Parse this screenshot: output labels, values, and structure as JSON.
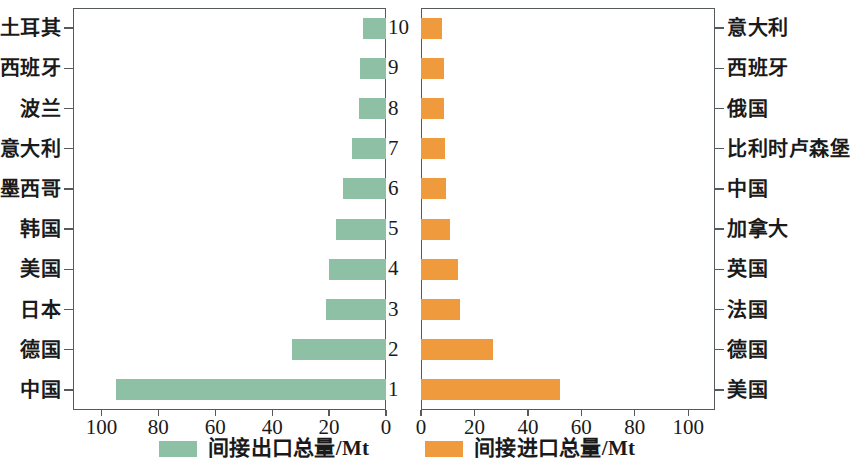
{
  "chart_data": {
    "type": "bar",
    "title": "",
    "orientation": "horizontal",
    "layout": "back-to-back dual panel (mirrored bar chart)",
    "panels": [
      {
        "id": "left",
        "name": "indirect-export",
        "legend_label": "间接出口总量/Mt",
        "series_name": "间接出口总量/Mt",
        "color": "#8ec0a6",
        "direction": "right-to-left",
        "xlabel": "",
        "ylabel": "",
        "xlim": [
          0,
          110
        ],
        "xticks": [
          100,
          80,
          60,
          40,
          20,
          0
        ],
        "xtick_labels": [
          "100",
          "80",
          "60",
          "40",
          "20",
          "0"
        ],
        "grid": false,
        "categories": [
          "土耳其",
          "西班牙",
          "波兰",
          "意大利",
          "墨西哥",
          "韩国",
          "美国",
          "日本",
          "德国",
          "中国"
        ],
        "values": [
          8,
          9,
          9.5,
          12,
          15,
          17.5,
          20,
          21,
          33,
          95
        ],
        "ranks": [
          10,
          9,
          8,
          7,
          6,
          5,
          4,
          3,
          2,
          1
        ]
      },
      {
        "id": "right",
        "name": "indirect-import",
        "legend_label": "间接进口总量/Mt",
        "series_name": "间接进口总量/Mt",
        "color": "#f09a3e",
        "direction": "left-to-right",
        "xlabel": "",
        "ylabel": "",
        "xlim": [
          0,
          110
        ],
        "xticks": [
          0,
          20,
          40,
          60,
          80,
          100
        ],
        "xtick_labels": [
          "0",
          "20",
          "40",
          "60",
          "80",
          "100"
        ],
        "grid": false,
        "categories": [
          "意大利",
          "西班牙",
          "俄国",
          "比利时卢森堡",
          "中国",
          "加拿大",
          "英国",
          "法国",
          "德国",
          "美国"
        ],
        "values": [
          8,
          8.5,
          8.5,
          9,
          9.5,
          11,
          14,
          14.5,
          27,
          52
        ],
        "ranks": [
          10,
          9,
          8,
          7,
          6,
          5,
          4,
          3,
          2,
          1
        ]
      }
    ],
    "center_index_labels": [
      "10",
      "9",
      "8",
      "7",
      "6",
      "5",
      "4",
      "3",
      "2",
      "1"
    ],
    "legend": {
      "position": "bottom",
      "entries": [
        {
          "label": "间接出口总量/Mt",
          "color": "#8ec0a6"
        },
        {
          "label": "间接进口总量/Mt",
          "color": "#f09a3e"
        }
      ]
    }
  },
  "colors": {
    "export_green": "#8ec0a6",
    "import_orange": "#f09a3e",
    "axis": "#555a5c",
    "text": "#1a1a1a",
    "background": "#ffffff"
  }
}
